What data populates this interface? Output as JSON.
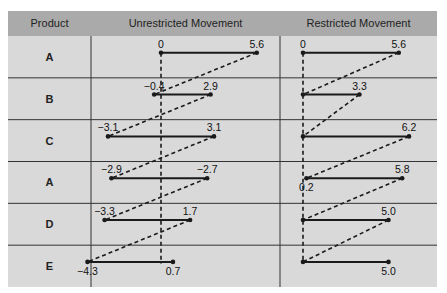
{
  "chart_data": {
    "type": "table",
    "title": "",
    "columns": [
      "Product",
      "Unrestricted Movement",
      "Restricted Movement"
    ],
    "rows": [
      {
        "product": "A",
        "unrestricted": {
          "start": 0,
          "end": 5.6,
          "start_label": "0",
          "end_label": "5.6"
        },
        "restricted": {
          "start": 0,
          "end": 5.6,
          "start_label": "0",
          "end_label": "5.6"
        }
      },
      {
        "product": "B",
        "unrestricted": {
          "start": -0.4,
          "end": 2.9,
          "start_label": "−0.4",
          "end_label": "2.9"
        },
        "restricted": {
          "start": 0,
          "end": 3.3,
          "start_label": "",
          "end_label": "3.3"
        }
      },
      {
        "product": "C",
        "unrestricted": {
          "start": -3.1,
          "end": 3.1,
          "start_label": "−3.1",
          "end_label": "3.1"
        },
        "restricted": {
          "start": 0,
          "end": 6.2,
          "start_label": "",
          "end_label": "6.2"
        }
      },
      {
        "product": "A",
        "unrestricted": {
          "start": -2.9,
          "end": 2.7,
          "start_label": "−2.9",
          "end_label": "−2.7"
        },
        "restricted": {
          "start": 0.2,
          "end": 5.8,
          "start_label": "0.2",
          "end_label": "5.8"
        }
      },
      {
        "product": "D",
        "unrestricted": {
          "start": -3.3,
          "end": 1.7,
          "start_label": "−3.3",
          "end_label": "1.7"
        },
        "restricted": {
          "start": 0,
          "end": 5.0,
          "start_label": "",
          "end_label": "5.0"
        }
      },
      {
        "product": "E",
        "unrestricted": {
          "start": -4.3,
          "end": 0.7,
          "start_label": "−4.3",
          "end_label": "0.7"
        },
        "restricted": {
          "start": 0,
          "end": 5.0,
          "start_label": "",
          "end_label": "5.0"
        }
      }
    ]
  },
  "colors": {
    "header_bg": "#aaaaaa",
    "body_bg": "#d9d9d9",
    "line": "#1a1a1a",
    "grid": "#333333"
  }
}
